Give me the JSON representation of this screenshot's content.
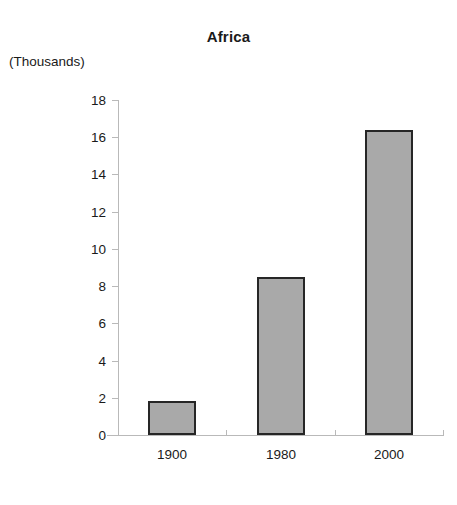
{
  "chart_data": {
    "type": "bar",
    "title": "Africa",
    "units_label": "(Thousands)",
    "xlabel": "",
    "ylabel": "",
    "categories": [
      "1900",
      "1980",
      "2000"
    ],
    "values": [
      1.85,
      8.5,
      16.4
    ],
    "ylim": [
      0,
      18
    ],
    "ytick_values": [
      0,
      2,
      4,
      6,
      8,
      10,
      12,
      14,
      16,
      18
    ],
    "ytick_labels": [
      "0",
      "2",
      "4",
      "6",
      "8",
      "10",
      "12",
      "14",
      "16",
      "18"
    ],
    "grid": false,
    "legend": null,
    "bar_fill_color": "#a9a9a9",
    "bar_border_color": "#262626",
    "axis_color": "#b9b9b9",
    "text_color": "#1a1a1a",
    "background_color": "#ffffff"
  }
}
